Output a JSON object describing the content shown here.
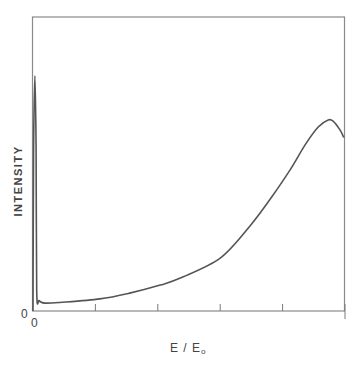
{
  "chart_data": {
    "type": "line",
    "title": "",
    "xlabel": "E / E",
    "xlabel_subscript": "o",
    "ylabel": "INTENSITY",
    "xlim": [
      0,
      5
    ],
    "ylim": [
      0,
      1
    ],
    "x_ticks": [
      0,
      1,
      2,
      3,
      4,
      5
    ],
    "x_tick_labels": [
      "0"
    ],
    "y_tick_labels": [
      "0"
    ],
    "grid": false,
    "legend": "none",
    "series": [
      {
        "name": "intensity",
        "x": [
          0.0,
          0.01,
          0.03,
          0.05,
          0.06,
          0.1,
          0.19,
          0.43,
          1.07,
          1.55,
          2.04,
          2.36,
          3.0,
          3.48,
          3.8,
          4.12,
          4.36,
          4.57,
          4.73,
          4.81,
          4.92,
          4.98
        ],
        "y": [
          0.0,
          0.55,
          0.8,
          0.55,
          0.07,
          0.035,
          0.027,
          0.029,
          0.041,
          0.061,
          0.088,
          0.112,
          0.18,
          0.29,
          0.38,
          0.48,
          0.565,
          0.626,
          0.65,
          0.646,
          0.616,
          0.59
        ]
      }
    ]
  },
  "colors": {
    "curve": "#555555",
    "frame": "#8a8a8a"
  }
}
